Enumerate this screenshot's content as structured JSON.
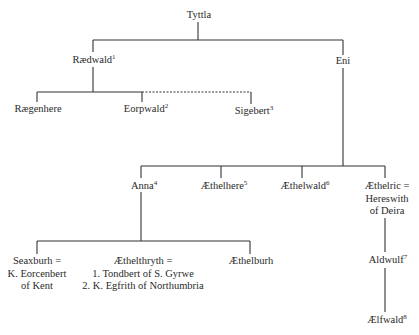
{
  "diagram": {
    "type": "family-tree",
    "nodes": {
      "tyttla": {
        "name": "Tyttla",
        "note": ""
      },
      "raedwald": {
        "name": "Rædwald",
        "note": "1"
      },
      "eni": {
        "name": "Eni",
        "note": ""
      },
      "raegenhere": {
        "name": "Rægenhere",
        "note": ""
      },
      "eorpwald": {
        "name": "Eorpwald",
        "note": "2"
      },
      "sigebert": {
        "name": "Sigebert",
        "note": "3"
      },
      "anna": {
        "name": "Anna",
        "note": "4"
      },
      "aethelhere": {
        "name": "Æthelhere",
        "note": "5"
      },
      "aethelwald": {
        "name": "Æthelwald",
        "note": "6"
      },
      "aethelric": {
        "lines": [
          "Æthelric =",
          "Hereswith",
          "of Deira"
        ]
      },
      "seaxburh": {
        "lines": [
          "Seaxburh =",
          "K. Eorcenbert",
          "of Kent"
        ]
      },
      "aethelthryth": {
        "lines": [
          "Æthelthryth =",
          "1. Tondbert of S. Gyrwe",
          "2. K. Egfrith of Northumbria"
        ]
      },
      "aethelburh": {
        "name": "Æthelburh",
        "note": ""
      },
      "aldwulf": {
        "name": "Aldwulf",
        "note": "7"
      },
      "aelfwald": {
        "name": "Ælfwald",
        "note": "8"
      }
    },
    "relations": [
      {
        "parent": "Tyttla",
        "children": [
          "Rædwald",
          "Eni"
        ]
      },
      {
        "parent": "Rædwald",
        "children": [
          "Rægenhere",
          "Eorpwald"
        ]
      },
      {
        "parent": "Rædwald",
        "children": [
          "Sigebert"
        ],
        "style": "dashed"
      },
      {
        "parent": "Eni",
        "children": [
          "Anna",
          "Æthelhere",
          "Æthelwald",
          "Æthelric"
        ]
      },
      {
        "parent": "Anna",
        "children": [
          "Seaxburh",
          "Æthelthryth",
          "Æthelburh"
        ]
      },
      {
        "parent": "Æthelric",
        "children": [
          "Aldwulf"
        ]
      },
      {
        "parent": "Aldwulf",
        "children": [
          "Ælfwald"
        ]
      }
    ]
  }
}
